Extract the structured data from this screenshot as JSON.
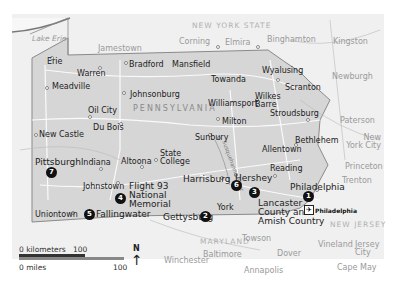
{
  "map": {
    "region_label": "PENNSYLVANIA",
    "neighbors": {
      "ny": "NEW YORK STATE",
      "md": "MARYLAND",
      "nj": "NEW JERSEY"
    },
    "water": {
      "lake": "Lake Erie",
      "river": "Susquehanna River"
    },
    "cities_in_state": {
      "erie": "Erie",
      "warren": "Warren",
      "meadville": "Meadville",
      "bradford": "Bradford",
      "mansfield": "Mansfield",
      "towanda": "Towanda",
      "wyalusing": "Wyalusing",
      "scranton": "Scranton",
      "wilkes_barre": "Wilkes Barre",
      "johnsonburg": "Johnsonburg",
      "oil_city": "Oil City",
      "du_bois": "Du Bois",
      "williamsport": "Williamsport",
      "milton": "Milton",
      "stroudsburg": "Stroudsburg",
      "bethlehem": "Bethlehem",
      "allentown": "Allentown",
      "sunbury": "Sunbury",
      "new_castle": "New Castle",
      "pittsburgh": "Pittsburgh",
      "indiana": "Indiana",
      "altoona": "Altoona",
      "state_college": "State College",
      "johnstown": "Johnstown",
      "harrisburg": "Harrisburg",
      "hershey": "Hershey",
      "reading": "Reading",
      "philadelphia": "Philadelphia",
      "york": "York",
      "uniontown": "Uniontown",
      "gettysburg": "Gettysburg"
    },
    "cities_outside": {
      "jamestown": "Jamestown",
      "corning": "Corning",
      "elmira": "Elmira",
      "binghamton": "Binghamton",
      "kingston": "Kingston",
      "newburgh": "Newburgh",
      "paterson": "Paterson",
      "new_york": "New York City",
      "princeton": "Princeton",
      "trenton": "Trenton",
      "towson": "Towson",
      "baltimore": "Baltimore",
      "winchester": "Winchester",
      "dover": "Dover",
      "annapolis": "Annapolis",
      "vineland": "Vineland",
      "jersey_city": "Jersey City",
      "cape_may": "Cape May"
    },
    "attractions": [
      {
        "num": "1",
        "name": "Philadelphia"
      },
      {
        "num": "2",
        "name": "Gettysburg"
      },
      {
        "num": "3",
        "name": "Lancaster County and Amish Country"
      },
      {
        "num": "4",
        "name": "Flight 93 National Memorial"
      },
      {
        "num": "5",
        "name": "Fallingwater"
      },
      {
        "num": "6",
        "name": "Hershey"
      },
      {
        "num": "7",
        "name": "Pittsburgh"
      }
    ],
    "airport": {
      "label": "Philadelphia",
      "icon": "airplane-icon"
    },
    "highways": [
      "6",
      "80",
      "81",
      "79",
      "76",
      "70",
      "81",
      "78",
      "83",
      "95",
      "15",
      "99",
      "219",
      "476",
      "87",
      "84",
      "68"
    ],
    "scale": {
      "km_label": "0 kilometers",
      "km_value": "100",
      "mi_label": "0 miles",
      "mi_value": "100"
    },
    "north": "N",
    "colors": {
      "state_fill": "#d6d6d6",
      "outside_fill": "#f0f0f0",
      "border": "#8a8a8a",
      "marker": "#111111"
    }
  }
}
